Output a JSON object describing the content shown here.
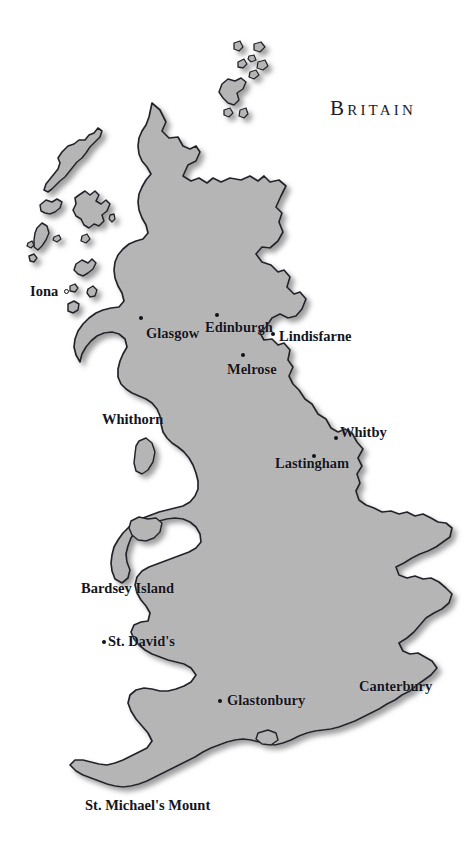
{
  "document": {
    "kind": "historical-map",
    "title": "Britain",
    "background_color": "#ffffff"
  },
  "map": {
    "land_fill": "#b5b5b5",
    "land_stroke": "#23232b",
    "shadow_color": "#9a9a9a",
    "region_name": "Britain"
  },
  "title_block": {
    "text": "Britain",
    "x": 330,
    "y": 106
  },
  "places": [
    {
      "name": "Iona",
      "label": "Iona",
      "label_x": 30,
      "label_y": 284,
      "marker": "ring",
      "marker_x": 64,
      "marker_y": 289
    },
    {
      "name": "Glasgow",
      "label": "Glasgow",
      "label_x": 146,
      "label_y": 326,
      "marker": "dot",
      "marker_x": 139,
      "marker_y": 316
    },
    {
      "name": "Edinburgh",
      "label": "Edinburgh",
      "label_x": 205,
      "label_y": 320,
      "marker": "dot",
      "marker_x": 215,
      "marker_y": 313
    },
    {
      "name": "Lindisfarne",
      "label": "Lindisfarne",
      "label_x": 279,
      "label_y": 329,
      "marker": "dot",
      "marker_x": 271,
      "marker_y": 332
    },
    {
      "name": "Melrose",
      "label": "Melrose",
      "label_x": 227,
      "label_y": 362,
      "marker": "dot",
      "marker_x": 241,
      "marker_y": 353
    },
    {
      "name": "Whithorn",
      "label": "Whithorn",
      "label_x": 102,
      "label_y": 412,
      "marker": "none",
      "marker_x": null,
      "marker_y": null
    },
    {
      "name": "Whitby",
      "label": "Whitby",
      "label_x": 340,
      "label_y": 425,
      "marker": "dot",
      "marker_x": 334,
      "marker_y": 436
    },
    {
      "name": "Lastingham",
      "label": "Lastingham",
      "label_x": 275,
      "label_y": 456,
      "marker": "dot",
      "marker_x": 312,
      "marker_y": 454
    },
    {
      "name": "Bardsey Island",
      "label": "Bardsey Island",
      "label_x": 81,
      "label_y": 581,
      "marker": "none",
      "marker_x": null,
      "marker_y": null
    },
    {
      "name": "St. David's",
      "label": "St. David's",
      "label_x": 108,
      "label_y": 634,
      "marker": "dot",
      "marker_x": 102,
      "marker_y": 640
    },
    {
      "name": "Glastonbury",
      "label": "Glastonbury",
      "label_x": 227,
      "label_y": 693,
      "marker": "dot",
      "marker_x": 218,
      "marker_y": 699
    },
    {
      "name": "Canterbury",
      "label": "Canterbury",
      "label_x": 359,
      "label_y": 679,
      "marker": "none",
      "marker_x": null,
      "marker_y": null
    },
    {
      "name": "St. Michael's Mount",
      "label": "St. Michael's Mount",
      "label_x": 85,
      "label_y": 798,
      "marker": "none",
      "marker_x": null,
      "marker_y": null
    }
  ]
}
